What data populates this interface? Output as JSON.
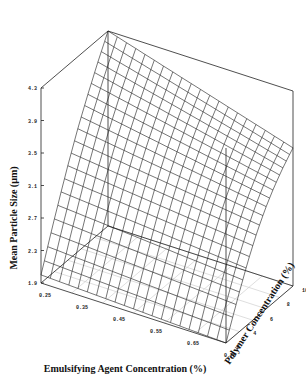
{
  "chart_data": {
    "type": "surface3d",
    "title": "",
    "xlabel": "Emulsifying Agent Concentration (%)",
    "ylabel": "Mean Particle Size (µm)",
    "zlabel": "Polymer Concentration (%)",
    "x_ticks": [
      "0.25",
      "0.35",
      "0.45",
      "0.55",
      "0.65",
      "0.75"
    ],
    "y_ticks": [
      "1.9",
      "2.3",
      "2.7",
      "3.1",
      "3.5",
      "3.9",
      "4.3"
    ],
    "z_ticks": [
      "2",
      "4",
      "6",
      "8",
      "10"
    ],
    "xlim": [
      0.25,
      0.75
    ],
    "ylim": [
      1.9,
      4.3
    ],
    "zlim": [
      2,
      10
    ],
    "grid": false,
    "legend": null,
    "surface_description": "Wireframe response surface; particle size increases with polymer concentration and decreases with emulsifying agent concentration",
    "corner_values": [
      {
        "emulsifier": 0.25,
        "polymer": 2,
        "size": 2.0
      },
      {
        "emulsifier": 0.75,
        "polymer": 2,
        "size": 1.9
      },
      {
        "emulsifier": 0.25,
        "polymer": 10,
        "size": 4.3
      },
      {
        "emulsifier": 0.75,
        "polymer": 10,
        "size": 3.6
      }
    ],
    "mesh_resolution": [
      20,
      20
    ]
  },
  "labels": {
    "x_axis": "Emulsifying Agent Concentration (%)",
    "y_axis": "Mean Particle Size (µm)",
    "z_axis": "Polymer Concentration (%)"
  }
}
